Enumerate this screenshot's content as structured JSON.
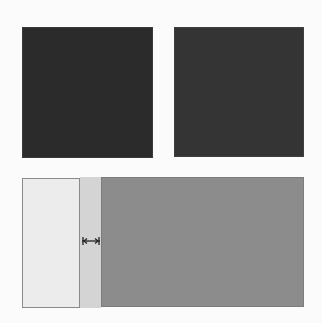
{
  "diagram": {
    "top_blocks": [
      {
        "name": "dark-square-left",
        "color": "#2b2b2b"
      },
      {
        "name": "dark-square-right",
        "color": "#343434"
      }
    ],
    "split_layout": {
      "left_pane_color": "#ececec",
      "splitter_color": "#d4d4d4",
      "right_pane_color": "#8c8c8c",
      "splitter_icon": "resize-horizontal-icon"
    }
  }
}
